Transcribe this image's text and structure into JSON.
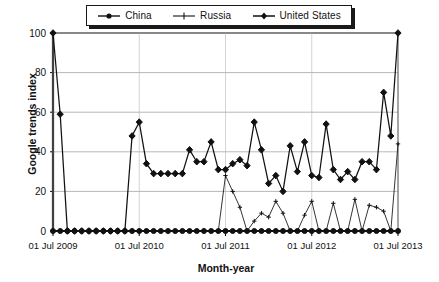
{
  "chart_data": {
    "type": "line",
    "title": "",
    "xlabel": "Month-year",
    "ylabel": "Google trends index",
    "ylim": [
      0,
      100
    ],
    "yticks": [
      0,
      20,
      40,
      60,
      80,
      100
    ],
    "grid": true,
    "legend_position": "top-center",
    "xtick_labels": [
      "01 Jul 2009",
      "01 Jul 2010",
      "01 Jul 2011",
      "01 Jul 2012",
      "01 Jul 2013"
    ],
    "xtick_indices": [
      0,
      12,
      24,
      36,
      48
    ],
    "x": [
      "2009-07",
      "2009-08",
      "2009-09",
      "2009-10",
      "2009-11",
      "2009-12",
      "2010-01",
      "2010-02",
      "2010-03",
      "2010-04",
      "2010-05",
      "2010-06",
      "2010-07",
      "2010-08",
      "2010-09",
      "2010-10",
      "2010-11",
      "2010-12",
      "2011-01",
      "2011-02",
      "2011-03",
      "2011-04",
      "2011-05",
      "2011-06",
      "2011-07",
      "2011-08",
      "2011-09",
      "2011-10",
      "2011-11",
      "2011-12",
      "2012-01",
      "2012-02",
      "2012-03",
      "2012-04",
      "2012-05",
      "2012-06",
      "2012-07",
      "2012-08",
      "2012-09",
      "2012-10",
      "2012-11",
      "2012-12",
      "2013-01",
      "2013-02",
      "2013-03",
      "2013-04",
      "2013-05",
      "2013-06",
      "2013-07"
    ],
    "series": [
      {
        "name": "United States",
        "marker": "diamond",
        "values": [
          100,
          59,
          0,
          0,
          0,
          0,
          0,
          0,
          0,
          0,
          0,
          48,
          55,
          34,
          29,
          29,
          29,
          29,
          29,
          41,
          35,
          35,
          45,
          31,
          31,
          34,
          36,
          33,
          55,
          41,
          24,
          28,
          20,
          43,
          30,
          45,
          28,
          27,
          54,
          31,
          26,
          30,
          26,
          35,
          35,
          31,
          70,
          48,
          100
        ]
      },
      {
        "name": "Russia",
        "marker": "plus",
        "values": [
          0,
          0,
          0,
          0,
          0,
          0,
          0,
          0,
          0,
          0,
          0,
          0,
          0,
          0,
          0,
          0,
          0,
          0,
          0,
          0,
          0,
          0,
          0,
          0,
          28,
          20,
          12,
          0,
          5,
          9,
          7,
          15,
          9,
          0,
          0,
          8,
          15,
          0,
          0,
          14,
          0,
          0,
          16,
          0,
          13,
          12,
          10,
          0,
          44
        ]
      },
      {
        "name": "China",
        "marker": "circle",
        "values": [
          0,
          0,
          0,
          0,
          0,
          0,
          0,
          0,
          0,
          0,
          0,
          0,
          0,
          0,
          0,
          0,
          0,
          0,
          0,
          0,
          0,
          0,
          0,
          0,
          0,
          0,
          0,
          0,
          0,
          0,
          0,
          0,
          0,
          0,
          0,
          0,
          0,
          0,
          0,
          0,
          0,
          0,
          0,
          0,
          0,
          0,
          0,
          0,
          0
        ]
      }
    ]
  },
  "legend": {
    "items": [
      {
        "label": "China",
        "marker": "circle"
      },
      {
        "label": "Russia",
        "marker": "plus"
      },
      {
        "label": "United States",
        "marker": "diamond"
      }
    ]
  },
  "colors": {
    "series": "#111111",
    "grid": "#9a9a9a",
    "background": "#ffffff"
  }
}
